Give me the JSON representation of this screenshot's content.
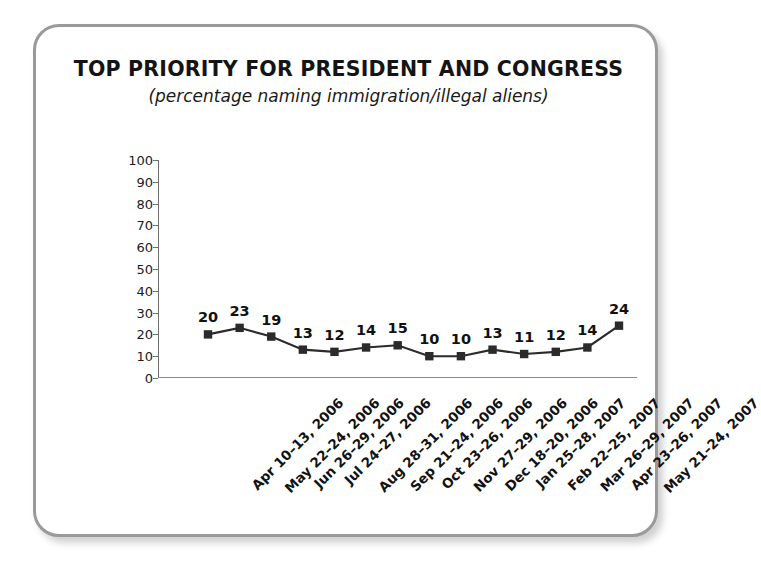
{
  "chart_data": {
    "type": "line",
    "title": "TOP PRIORITY FOR PRESIDENT AND CONGRESS",
    "subtitle": "(percentage naming immigration/illegal aliens)",
    "xlabel": "",
    "ylabel": "",
    "ylim": [
      0,
      100
    ],
    "yticks": [
      0,
      10,
      20,
      30,
      40,
      50,
      60,
      70,
      80,
      90,
      100
    ],
    "grid": false,
    "legend": "none",
    "marker": "square",
    "series_color": "#2b2b2b",
    "categories": [
      "Apr 10–13, 2006",
      "May 22–24, 2006",
      "Jun 26–29, 2006",
      "Jul 24–27, 2006",
      "Aug 28–31, 2006",
      "Sep 21–24, 2006",
      "Oct 23–26, 2006",
      "Nov 27–29, 2006",
      "Dec 18–20, 2006",
      "Jan 25–28, 2007",
      "Feb 22–25, 2007",
      "Mar 26–29, 2007",
      "Apr 23–26, 2007",
      "May 21–24, 2007"
    ],
    "values": [
      20,
      23,
      19,
      13,
      12,
      14,
      15,
      10,
      10,
      13,
      11,
      12,
      14,
      24
    ],
    "point_labels": [
      "20",
      "23",
      "19",
      "13",
      "12",
      "14",
      "15",
      "10",
      "10",
      "13",
      "11",
      "12",
      "14",
      "24"
    ]
  },
  "style": {
    "frame_border_color": "#9a9a9a",
    "axis_color": "#6f6f6f",
    "text_color": "#141414",
    "background": "#ffffff"
  }
}
